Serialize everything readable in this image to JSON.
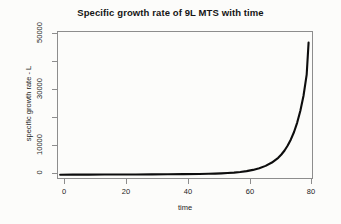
{
  "chart_data": {
    "type": "line",
    "title": "Specific growth rate of 9L MTS with time",
    "xlabel": "time",
    "ylabel": "specific growth rate - L",
    "xlim": [
      0,
      81
    ],
    "ylim": [
      -1500,
      52000
    ],
    "grid": false,
    "legend": null,
    "xticks": [
      0,
      20,
      40,
      60,
      80
    ],
    "xtick_labels": [
      "0",
      "20",
      "40",
      "60",
      "80"
    ],
    "yticks": [
      0,
      10000,
      20000,
      30000,
      40000,
      50000
    ],
    "ytick_labels": [
      "0",
      "10000",
      "",
      "30000",
      "",
      "50000"
    ],
    "series": [
      {
        "name": "specific growth rate - L",
        "x": [
          1,
          5,
          10,
          15,
          20,
          25,
          30,
          35,
          40,
          45,
          48,
          50,
          52,
          54,
          56,
          58,
          60,
          62,
          64,
          66,
          68,
          70,
          71,
          72,
          73,
          74,
          75,
          76,
          77,
          78,
          79,
          79.6
        ],
        "y": [
          60,
          70,
          85,
          100,
          120,
          145,
          175,
          215,
          265,
          330,
          390,
          450,
          540,
          660,
          820,
          1040,
          1350,
          1790,
          2400,
          3250,
          4450,
          6150,
          7350,
          8800,
          10600,
          12800,
          15500,
          18900,
          23200,
          28600,
          36200,
          47800
        ]
      }
    ]
  },
  "axes": {
    "y_tick_positions_px": [
      173,
      145,
      117,
      89,
      61,
      33
    ],
    "y_tick_labels": [
      "0",
      "10000",
      "",
      "30000",
      "",
      "50000"
    ],
    "x_tick_positions_px": [
      64,
      126,
      188,
      250,
      311
    ],
    "x_tick_labels": [
      "0",
      "20",
      "40",
      "60",
      "80"
    ]
  },
  "colors": {
    "curve": "#0d0d0d",
    "axis": "#8d8d8d",
    "text": "#1c1c1c",
    "background": "#fcfcfa"
  }
}
